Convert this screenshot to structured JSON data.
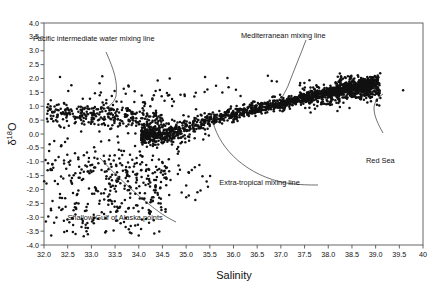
{
  "chart_data": {
    "type": "scatter",
    "title": "",
    "xlabel": "Salinity",
    "ylabel": "δ¹⁸O",
    "ylabel_parts": {
      "delta": "δ",
      "sup": "18",
      "o": "O"
    },
    "xlim": [
      32.0,
      40.0
    ],
    "ylim": [
      -4.0,
      4.0
    ],
    "xticks": [
      32.0,
      32.5,
      33.0,
      33.5,
      34.0,
      34.5,
      35.0,
      35.5,
      36.0,
      36.5,
      37.0,
      37.5,
      38.0,
      38.5,
      39.0,
      39.5,
      40.0
    ],
    "xtick_labels": [
      "32.0",
      "32.5",
      "33.0",
      "33.5",
      "34.0",
      "34.5",
      "35.0",
      "35.5",
      "36.0",
      "36.5",
      "37.0",
      "37.5",
      "38.0",
      "38.5",
      "39.0",
      "39.5",
      "40"
    ],
    "yticks": [
      4.0,
      3.5,
      3.0,
      2.5,
      2.0,
      1.5,
      1.0,
      0.5,
      0.0,
      -0.5,
      -1.0,
      -1.5,
      -2.0,
      -2.5,
      -3.0,
      -3.5,
      -4.0
    ],
    "ytick_labels": [
      "4.0",
      "3.5",
      "3.0",
      "2.5",
      "2.0",
      "1.5",
      "1.0",
      "0.5",
      "0.0",
      "-0.5",
      "-1.0",
      "-1.5",
      "-2.0",
      "-2.5",
      "-3.0",
      "-3.5",
      "-4.0"
    ],
    "grid": false,
    "legend": "none",
    "marker": {
      "shape": "circle",
      "color": "#111111",
      "size": 1.5
    },
    "annotations": [
      {
        "id": "pacific",
        "text": "Pacific intermediate water mixing line",
        "x": 33.05,
        "y": 3.35,
        "leader": "M 106,52 C 114,70 118,82 116,96 C 114,104 107,108 99,112"
      },
      {
        "id": "mediterranean",
        "text": "Mediterranean mixing line",
        "x": 37.05,
        "y": 3.45,
        "leader": "M 306,40 C 300,56 294,70 288,86 C 285,92 283,96 281,99"
      },
      {
        "id": "extratropical",
        "text": "Extra-tropical mixing line",
        "x": 36.55,
        "y": -1.85,
        "leader": "M 213,122 C 220,150 248,176 286,183 C 300,185 310,185 318,185"
      },
      {
        "id": "shallow-gulf",
        "text": "Shallow Gulf of Alaska points",
        "x": 33.5,
        "y": -3.1,
        "leader": "M 100,158 C 118,178 142,200 162,214 C 168,218 172,220 176,222"
      },
      {
        "id": "red-sea",
        "text": "Red Sea",
        "x": 39.1,
        "y": -1.05,
        "leader": "M 383,133 C 378,124 374,116 374,108 C 374,102 378,98 383,94"
      }
    ],
    "series": [
      {
        "name": "Extra-tropical / global band",
        "description": "Dense linear band rising from (32.2, 0.6) to (39.0, 1.9)"
      },
      {
        "name": "Shallow Gulf of Alaska points",
        "description": "Diffuse low-salinity cluster from (32.0, -0.5) down to (34.5, -3.6)"
      },
      {
        "name": "Red Sea",
        "description": "Isolated high-salinity point near (39.6, 1.6)"
      }
    ],
    "point_count_approx": 2000
  }
}
